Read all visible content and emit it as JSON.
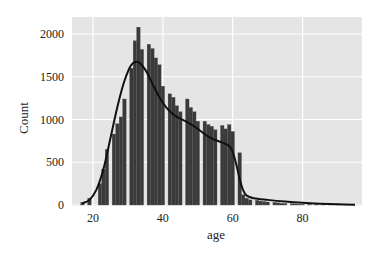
{
  "chart_data": {
    "type": "bar",
    "subtype": "histogram_with_kde",
    "title": "",
    "xlabel": "age",
    "ylabel": "Count",
    "xlim": [
      14,
      97
    ],
    "ylim": [
      0,
      2100
    ],
    "x_ticks": [
      20,
      40,
      60,
      80
    ],
    "y_ticks": [
      0,
      500,
      1000,
      1500,
      2000
    ],
    "grid": true,
    "background": "#e5e5e5",
    "bar_color": "#3a3a3a",
    "kde_color": "#111111",
    "bins": [
      {
        "age": 17,
        "count": 30
      },
      {
        "age": 18,
        "count": 0
      },
      {
        "age": 19,
        "count": 80
      },
      {
        "age": 20,
        "count": 0
      },
      {
        "age": 21,
        "count": 0
      },
      {
        "age": 22,
        "count": 250
      },
      {
        "age": 23,
        "count": 420
      },
      {
        "age": 24,
        "count": 650
      },
      {
        "age": 25,
        "count": 0
      },
      {
        "age": 26,
        "count": 830
      },
      {
        "age": 27,
        "count": 950
      },
      {
        "age": 28,
        "count": 1030
      },
      {
        "age": 29,
        "count": 1240
      },
      {
        "age": 30,
        "count": 0
      },
      {
        "age": 31,
        "count": 1600
      },
      {
        "age": 32,
        "count": 1920
      },
      {
        "age": 33,
        "count": 2080
      },
      {
        "age": 34,
        "count": 1820
      },
      {
        "age": 35,
        "count": 0
      },
      {
        "age": 36,
        "count": 1880
      },
      {
        "age": 37,
        "count": 1830
      },
      {
        "age": 38,
        "count": 1720
      },
      {
        "age": 39,
        "count": 1640
      },
      {
        "age": 40,
        "count": 1390
      },
      {
        "age": 41,
        "count": 0
      },
      {
        "age": 42,
        "count": 1300
      },
      {
        "age": 43,
        "count": 1260
      },
      {
        "age": 44,
        "count": 1160
      },
      {
        "age": 45,
        "count": 1090
      },
      {
        "age": 46,
        "count": 0
      },
      {
        "age": 47,
        "count": 1240
      },
      {
        "age": 48,
        "count": 1140
      },
      {
        "age": 49,
        "count": 1090
      },
      {
        "age": 50,
        "count": 980
      },
      {
        "age": 51,
        "count": 0
      },
      {
        "age": 52,
        "count": 980
      },
      {
        "age": 53,
        "count": 940
      },
      {
        "age": 54,
        "count": 920
      },
      {
        "age": 55,
        "count": 880
      },
      {
        "age": 56,
        "count": 0
      },
      {
        "age": 57,
        "count": 930
      },
      {
        "age": 58,
        "count": 890
      },
      {
        "age": 59,
        "count": 940
      },
      {
        "age": 60,
        "count": 860
      },
      {
        "age": 61,
        "count": 0
      },
      {
        "age": 62,
        "count": 610
      },
      {
        "age": 63,
        "count": 120
      },
      {
        "age": 64,
        "count": 80
      },
      {
        "age": 65,
        "count": 60
      },
      {
        "age": 66,
        "count": 0
      },
      {
        "age": 67,
        "count": 55
      },
      {
        "age": 68,
        "count": 45
      },
      {
        "age": 69,
        "count": 40
      },
      {
        "age": 70,
        "count": 35
      },
      {
        "age": 71,
        "count": 0
      },
      {
        "age": 72,
        "count": 30
      },
      {
        "age": 73,
        "count": 25
      },
      {
        "age": 74,
        "count": 20
      },
      {
        "age": 75,
        "count": 18
      },
      {
        "age": 76,
        "count": 0
      },
      {
        "age": 77,
        "count": 15
      },
      {
        "age": 78,
        "count": 12
      },
      {
        "age": 79,
        "count": 10
      },
      {
        "age": 80,
        "count": 8
      },
      {
        "age": 82,
        "count": 6
      },
      {
        "age": 84,
        "count": 5
      },
      {
        "age": 86,
        "count": 4
      },
      {
        "age": 88,
        "count": 3
      },
      {
        "age": 90,
        "count": 3
      },
      {
        "age": 94,
        "count": 2
      }
    ],
    "kde": {
      "x": [
        17,
        19,
        21,
        23,
        25,
        27,
        29,
        31,
        33,
        35,
        37,
        39,
        41,
        43,
        45,
        47,
        49,
        51,
        53,
        55,
        57,
        59,
        60,
        61,
        62,
        63,
        64,
        66,
        70,
        75,
        80,
        85,
        90,
        95
      ],
      "y": [
        20,
        60,
        180,
        420,
        780,
        1150,
        1450,
        1640,
        1670,
        1580,
        1420,
        1260,
        1140,
        1060,
        1010,
        970,
        920,
        860,
        800,
        760,
        730,
        690,
        620,
        480,
        300,
        170,
        110,
        80,
        60,
        40,
        25,
        15,
        8,
        3
      ]
    }
  }
}
